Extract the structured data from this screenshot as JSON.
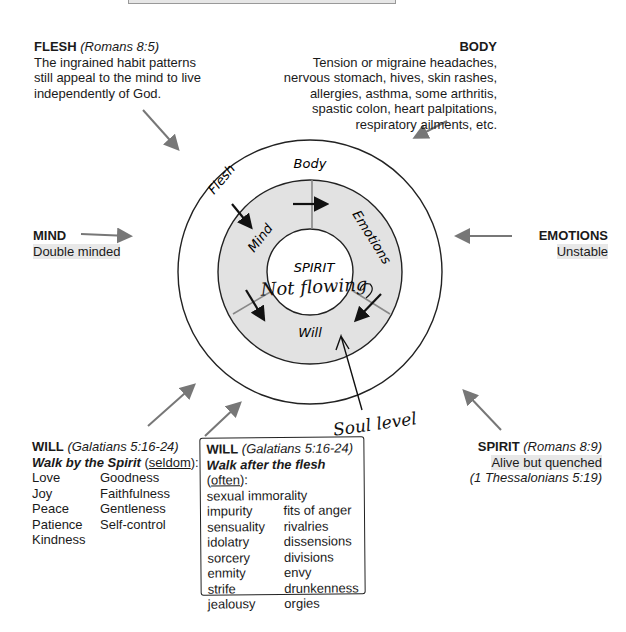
{
  "flesh": {
    "title": "FLESH",
    "ref": "(Romans 8:5)",
    "lines": [
      "The ingrained habit patterns",
      "still appeal to the mind to live",
      "independently of God."
    ]
  },
  "body": {
    "title": "BODY",
    "lines": [
      "Tension or migraine headaches,",
      "nervous stomach, hives, skin rashes,",
      "allergies, asthma, some arthritis,",
      "spastic colon, heart palpitations,",
      "respiratory ailments, etc."
    ]
  },
  "mind": {
    "title": "MIND",
    "desc": "Double minded"
  },
  "emotions": {
    "title": "EMOTIONS",
    "desc": "Unstable"
  },
  "spirit": {
    "title": "SPIRIT",
    "ref": "(Romans 8:9)",
    "desc": "Alive but quenched",
    "ref2": "(1 Thessalonians 5:19)"
  },
  "will_spirit": {
    "title": "WILL",
    "ref": "(Galatians 5:16-24)",
    "walk": "Walk by the Spirit",
    "freq": "seldom",
    "colon": ":",
    "col1": [
      "Love",
      "Joy",
      "Peace",
      "Patience",
      "Kindness"
    ],
    "col2": [
      "Goodness",
      "Faithfulness",
      "Gentleness",
      "Self-control"
    ]
  },
  "will_flesh": {
    "title": "WILL",
    "ref": "(Galatians 5:16-24)",
    "walk": "Walk after the flesh",
    "freq": "often",
    "colon": ":",
    "first": "sexual immorality",
    "col1": [
      "impurity",
      "sensuality",
      "idolatry",
      "sorcery",
      "enmity",
      "strife",
      "jealousy"
    ],
    "col2": [
      "fits of anger",
      "rivalries",
      "dissensions",
      "divisions",
      "envy",
      "drunkenness",
      "orgies"
    ]
  },
  "rings": {
    "body": "Body",
    "flesh": "Flesh",
    "mind": "Mind",
    "emotions": "Emotions",
    "will": "Will",
    "spirit": "SPIRIT"
  },
  "handwritten": {
    "not_flowing": "Not flowing",
    "soul_level": "Soul level"
  }
}
